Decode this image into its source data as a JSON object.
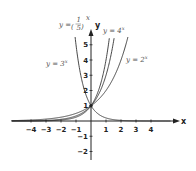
{
  "chart_data": {
    "type": "line",
    "title": "",
    "xlabel": "x",
    "ylabel": "y",
    "xlim": [
      -5,
      5
    ],
    "ylim": [
      -2.5,
      5.5
    ],
    "grid": false,
    "x_ticks": [
      -4,
      -3,
      -2,
      -1,
      1,
      2,
      3,
      4
    ],
    "y_ticks": [
      -2,
      -1,
      1,
      2,
      3,
      4,
      5
    ],
    "x_tick_labels": [
      "−4",
      "−3",
      "−2",
      "−1",
      "1",
      "2",
      "3",
      "4"
    ],
    "y_tick_labels": [
      "−2",
      "−1",
      "1",
      "2",
      "3",
      "4",
      "5"
    ],
    "series": [
      {
        "name": "y = 2^x",
        "base": 2,
        "label": "y = 2ˣ"
      },
      {
        "name": "y = 3^x",
        "base": 3,
        "label": "y = 3ˣ"
      },
      {
        "name": "y = 4^x",
        "base": 4,
        "label": "y = 4ˣ"
      },
      {
        "name": "y = (1/5)^x",
        "base": 0.2,
        "label": "y = (1/5)ˣ"
      }
    ],
    "annotations": [
      {
        "text": "y = 3ˣ",
        "near": "left of y-axis"
      },
      {
        "text": "y = 4ˣ",
        "near": "top right of y-axis"
      },
      {
        "text": "y = 2ˣ",
        "near": "right"
      },
      {
        "text": "y = (1/5)ˣ",
        "near": "top left of y-axis"
      }
    ],
    "common_point": [
      0,
      1
    ]
  },
  "labels": {
    "x_axis": "x",
    "y_axis": "y",
    "eq_prefix": "y =",
    "curve_2": "y = 2",
    "curve_3": "y = 3",
    "curve_4": "y = 4",
    "exp": "x",
    "frac_num": "1",
    "frac_den": "5"
  },
  "colors": {
    "axis": "#222222",
    "curve": "#333333"
  }
}
